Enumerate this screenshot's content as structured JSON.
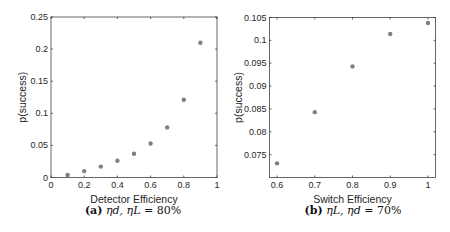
{
  "chart_data": [
    {
      "type": "scatter",
      "title": "",
      "xlabel": "Detector Efficiency",
      "ylabel": "p(success)",
      "caption": "(a) η_d, η_L = 80%",
      "caption_parts": {
        "label": "(a)",
        "vars": "ηd, ηL",
        "eq": "= 80%"
      },
      "xlim": [
        0,
        1
      ],
      "ylim": [
        0,
        0.25
      ],
      "xticks": [
        0,
        0.2,
        0.4,
        0.6,
        0.8,
        1
      ],
      "xtick_labels": [
        "0",
        "0.2",
        "0.4",
        "0.6",
        "0.8",
        "1"
      ],
      "yticks": [
        0,
        0.05,
        0.1,
        0.15,
        0.2,
        0.25
      ],
      "ytick_labels": [
        "0",
        "0.05",
        "0.1",
        "0.15",
        "0.2",
        "0.25"
      ],
      "grid": false,
      "marker_color": "#7f7f7f",
      "x": [
        0.1,
        0.2,
        0.3,
        0.4,
        0.5,
        0.6,
        0.7,
        0.8,
        0.9
      ],
      "values": [
        0.004,
        0.01,
        0.017,
        0.026,
        0.037,
        0.053,
        0.078,
        0.121,
        0.21
      ]
    },
    {
      "type": "scatter",
      "title": "",
      "xlabel": "Switch Efficiency",
      "ylabel": "p(success)",
      "caption": "(b) η_L, η_d = 70%",
      "caption_parts": {
        "label": "(b)",
        "vars": "ηL, ηd",
        "eq": "= 70%"
      },
      "xlim": [
        0.58,
        1.02
      ],
      "ylim": [
        0.07,
        0.105
      ],
      "xticks": [
        0.6,
        0.7,
        0.8,
        0.9,
        1
      ],
      "xtick_labels": [
        "0.6",
        "0.7",
        "0.8",
        "0.9",
        "1"
      ],
      "yticks": [
        0.075,
        0.08,
        0.085,
        0.09,
        0.095,
        0.1,
        0.105
      ],
      "ytick_labels": [
        "0.075",
        "0.08",
        "0.085",
        "0.09",
        "0.095",
        "0.1",
        "0.105"
      ],
      "grid": false,
      "marker_color": "#7f7f7f",
      "x": [
        0.6,
        0.7,
        0.8,
        0.9,
        1.0
      ],
      "values": [
        0.0731,
        0.0843,
        0.0943,
        0.1014,
        0.1038
      ]
    }
  ]
}
